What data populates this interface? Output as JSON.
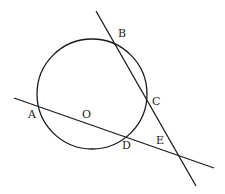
{
  "diagram": {
    "type": "geometry",
    "stroke_color": "#1a1a1a",
    "circle": {
      "cx": 92,
      "cy": 94,
      "r": 55,
      "center_label": "O"
    },
    "lines": [
      {
        "name": "line-AD-secant",
        "x1": 14,
        "y1": 98,
        "x2": 214,
        "y2": 168
      },
      {
        "name": "line-BC-secant",
        "x1": 96,
        "y1": 11,
        "x2": 196,
        "y2": 186
      }
    ],
    "points": {
      "A": {
        "label": "A",
        "x": 28,
        "y": 118
      },
      "B": {
        "label": "B",
        "x": 118,
        "y": 37
      },
      "C": {
        "label": "C",
        "x": 152,
        "y": 105
      },
      "D": {
        "label": "D",
        "x": 122,
        "y": 149
      },
      "E": {
        "label": "E",
        "x": 156,
        "y": 144
      },
      "O": {
        "label": "O",
        "x": 82,
        "y": 118
      }
    }
  }
}
